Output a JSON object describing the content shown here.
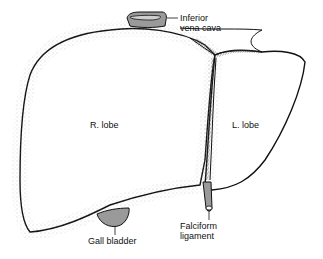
{
  "diagram": {
    "labels": {
      "ivc_line1": "Inferior",
      "ivc_line2": "vena cava",
      "right_lobe": "R. lobe",
      "left_lobe": "L. lobe",
      "gall_bladder": "Gall bladder",
      "falciform_line1": "Falciform",
      "falciform_line2": "ligament"
    },
    "colors": {
      "outline": "#111111",
      "fill": "#ffffff",
      "stipple": "#9a9a9a",
      "structure_fill": "#9a9a9a"
    }
  }
}
